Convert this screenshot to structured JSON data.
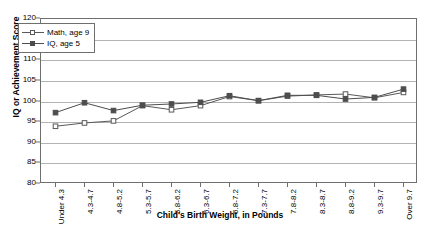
{
  "chart_data": {
    "type": "line",
    "title": "",
    "xlabel": "Child's Birth Weight, in Pounds",
    "ylabel": "IQ or Achievement Score",
    "ylim": [
      80,
      120
    ],
    "yticks": [
      80,
      85,
      90,
      95,
      100,
      105,
      110,
      115,
      120
    ],
    "grid": true,
    "legend_position": "top-left",
    "categories": [
      "Under 4.3",
      "4.3-4.7",
      "4.8-5.2",
      "5.3-5.7",
      "5.8-6.2",
      "6.3-6.7",
      "6.8-7.2",
      "7.3-7.7",
      "7.8-8.2",
      "8.3-8.7",
      "8.8-9.2",
      "9.3-9.7",
      "Over 9.7"
    ],
    "series": [
      {
        "name": "Math, age 9",
        "marker": "open-square",
        "color": "#595959",
        "values": [
          94.0,
          94.8,
          95.3,
          99.0,
          98.0,
          99.0,
          101.2,
          100.2,
          101.3,
          101.6,
          101.8,
          100.9,
          102.2
        ]
      },
      {
        "name": "IQ, age 5",
        "marker": "filled-square",
        "color": "#4d4d4d",
        "values": [
          97.3,
          99.7,
          97.8,
          99.1,
          99.4,
          99.8,
          101.4,
          100.2,
          101.5,
          101.5,
          100.6,
          101.0,
          103.0
        ]
      }
    ]
  },
  "axis": {
    "y_title": "IQ or Achievement Score",
    "x_title": "Child's Birth Weight, in Pounds"
  },
  "legend": {
    "entries": [
      {
        "label": "Math, age 9"
      },
      {
        "label": "IQ, age 5"
      }
    ]
  },
  "colors": {
    "frame": "#6f6f6f",
    "grid": "#b3b3b3",
    "series_math": "#595959",
    "series_iq": "#4d4d4d",
    "background": "#ffffff"
  }
}
